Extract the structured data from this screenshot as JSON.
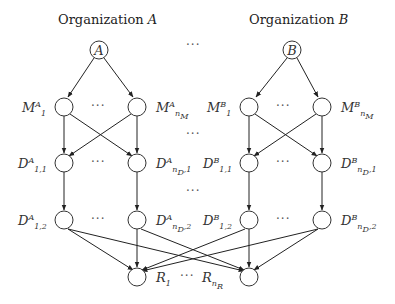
{
  "organizations": [
    {
      "title_prefix": "Organization",
      "title_var": "A",
      "root": "A",
      "M": [
        {
          "base": "M",
          "sup": "A",
          "sub": "1"
        },
        {
          "base": "M",
          "sup": "A",
          "sub": "n_M^A"
        }
      ],
      "D1": [
        {
          "base": "D",
          "sup": "A",
          "sub": "1,1"
        },
        {
          "base": "D",
          "sup": "A",
          "sub": "n_D^A,1"
        }
      ],
      "D2": [
        {
          "base": "D",
          "sup": "A",
          "sub": "1,2"
        },
        {
          "base": "D",
          "sup": "A",
          "sub": "n_D^1,2"
        }
      ]
    },
    {
      "title_prefix": "Organization",
      "title_var": "B",
      "root": "B",
      "M": [
        {
          "base": "M",
          "sup": "B",
          "sub": "1"
        },
        {
          "base": "M",
          "sup": "B",
          "sub": "n_M^B"
        }
      ],
      "D1": [
        {
          "base": "D",
          "sup": "B",
          "sub": "1,1"
        },
        {
          "base": "D",
          "sup": "B",
          "sub": "n_D^B,1"
        }
      ],
      "D2": [
        {
          "base": "D",
          "sup": "B",
          "sub": "1,2"
        },
        {
          "base": "D",
          "sup": "B",
          "sub": "n_D^B,2"
        }
      ]
    }
  ],
  "results": [
    {
      "base": "R",
      "sub": "1"
    },
    {
      "base": "R",
      "sub": "n_R"
    }
  ],
  "ellipsis": "···"
}
